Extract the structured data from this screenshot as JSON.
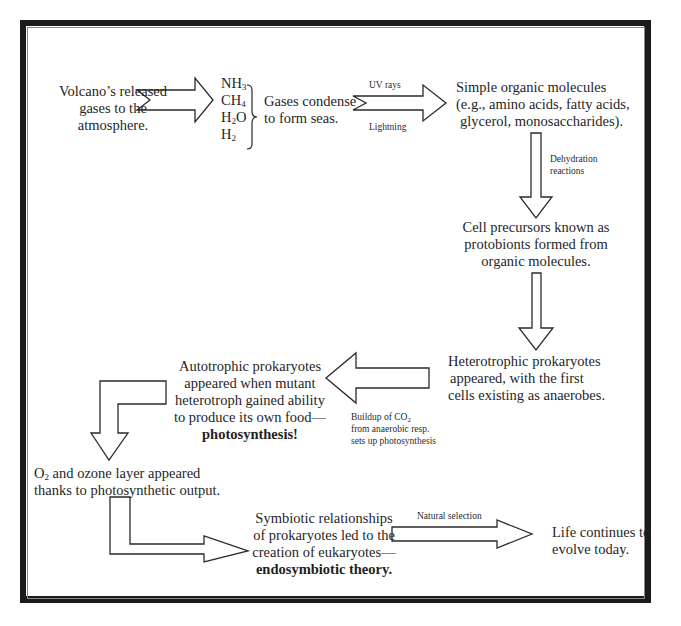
{
  "diagram": {
    "nodes": {
      "volcano": [
        "Volcano’s released",
        "gases to the",
        "atmosphere."
      ],
      "gases": {
        "list": [
          {
            "base": "NH",
            "sub": "3",
            "tail": ""
          },
          {
            "base": "CH",
            "sub": "4",
            "tail": ""
          },
          {
            "base": "H",
            "sub": "2",
            "tail": "O"
          },
          {
            "base": "H",
            "sub": "2",
            "tail": ""
          }
        ],
        "condense": [
          "Gases condense",
          "to form seas."
        ]
      },
      "organic": [
        "Simple organic molecules",
        "(e.g., amino acids, fatty acids,",
        "glycerol, monosaccharides)."
      ],
      "protobionts": [
        "Cell precursors known as",
        "protobionts formed from",
        "organic molecules."
      ],
      "heterotrophs": [
        "Heterotrophic prokaryotes",
        "appeared, with the first",
        "cells existing as anaerobes."
      ],
      "autotrophs": {
        "lines": [
          "Autotrophic prokaryotes",
          "appeared when mutant",
          "heterotroph gained ability",
          "to produce its own food—"
        ],
        "bold": "photosynthesis!"
      },
      "oxygen": {
        "o": "O",
        "sub": "2",
        "line1_rest": " and ozone layer appeared",
        "line2": "thanks to photosynthetic output."
      },
      "symbiotic": {
        "lines": [
          "Symbiotic relationships",
          "of prokaryotes led to the",
          "creation of eukaryotes—"
        ],
        "bold": "endosymbiotic theory."
      },
      "life": [
        "Life continues to",
        "evolve today."
      ]
    },
    "arrow_labels": {
      "uv": "UV rays",
      "lightning": "Lightning",
      "dehydration": [
        "Dehydration",
        "reactions"
      ],
      "co2": {
        "line1_pre": "Buildup of CO",
        "line1_sub": "2",
        "line2": "from anaerobic resp.",
        "line3": "sets up photosynthesis"
      },
      "natural_selection": "Natural selection"
    }
  }
}
